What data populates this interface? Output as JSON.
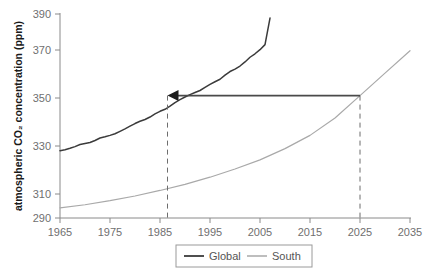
{
  "chart_data": {
    "type": "line",
    "title": "",
    "xlabel": "",
    "ylabel": "atmospheric CO₂ concentration (ppm)",
    "xlim": [
      1965,
      2035
    ],
    "ylim": [
      290,
      390
    ],
    "grid": false,
    "legend_position": "bottom-right",
    "xticks": [
      1965,
      1975,
      1985,
      1995,
      2005,
      2015,
      2025,
      2035
    ],
    "xtick_labels": [
      "1965",
      "1975",
      "1985",
      "1995",
      "2005",
      "2015",
      "2025",
      "2035"
    ],
    "yticks": [
      290,
      310,
      330,
      350,
      370,
      390
    ],
    "ytick_labels": [
      "290",
      "310",
      "330",
      "350",
      "370",
      "390"
    ],
    "series": [
      {
        "name": "Global",
        "color": "#3b3b3b",
        "x": [
          1965,
          1966,
          1967,
          1968,
          1969,
          1970,
          1971,
          1972,
          1973,
          1974,
          1975,
          1976,
          1977,
          1978,
          1979,
          1980,
          1981,
          1982,
          1983,
          1984,
          1985,
          1986,
          1987,
          1988,
          1989,
          1990,
          1991,
          1992,
          1993,
          1994,
          1995,
          1996,
          1997,
          1998,
          1999,
          2000,
          2001,
          2002,
          2003,
          2004,
          2005,
          2006,
          2007
        ],
        "values": [
          323.0,
          323.5,
          324.2,
          325.0,
          326.0,
          326.5,
          327.0,
          328.0,
          329.2,
          329.8,
          330.5,
          331.3,
          332.5,
          333.7,
          335.0,
          336.3,
          337.4,
          338.3,
          339.5,
          341.0,
          342.3,
          343.3,
          344.8,
          346.6,
          348.0,
          349.3,
          350.5,
          351.5,
          352.5,
          354.0,
          355.5,
          356.8,
          358.0,
          360.0,
          361.8,
          363.0,
          364.5,
          366.5,
          368.8,
          370.5,
          372.5,
          375.0,
          388.0
        ]
      },
      {
        "name": "South",
        "color": "#a9a9a9",
        "x": [
          1965,
          1970,
          1975,
          1980,
          1985,
          1990,
          1995,
          2000,
          2005,
          2010,
          2015,
          2020,
          2025,
          2030,
          2035
        ],
        "values": [
          295.0,
          296.5,
          298.5,
          300.8,
          303.5,
          306.5,
          310.0,
          314.0,
          318.5,
          324.0,
          330.5,
          339.0,
          350.0,
          361.0,
          372.0
        ]
      }
    ],
    "annotations": [
      {
        "type": "arrow",
        "label": "",
        "from": {
          "x": 2025,
          "y": 350
        },
        "to": {
          "x": 1986.5,
          "y": 350
        },
        "direction": "left",
        "color": "#4a4a4a"
      },
      {
        "type": "vline-dashed",
        "x": 1986.5,
        "y_from": 290,
        "y_to": 350,
        "color": "#6d6d6d"
      },
      {
        "type": "vline-dashed",
        "x": 2025,
        "y_from": 290,
        "y_to": 350,
        "color": "#6d6d6d"
      }
    ]
  },
  "legend": {
    "entries": [
      {
        "label": "Global"
      },
      {
        "label": "South"
      }
    ]
  },
  "axis": {
    "y_title": "atmospheric CO₂ concentration (ppm)"
  }
}
